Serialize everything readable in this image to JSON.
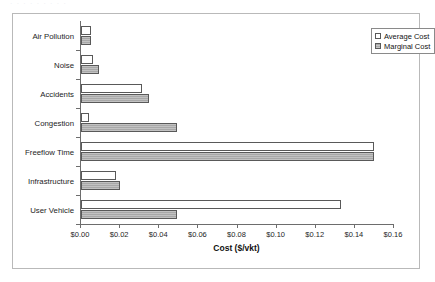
{
  "scan_artifact": "· · ·   · ·      ·   ·          ·      ·",
  "chart_data": {
    "type": "bar",
    "orientation": "horizontal",
    "title": "",
    "xlabel": "Cost  ($/vkt)",
    "ylabel": "",
    "categories": [
      "Air Pollution",
      "Noise",
      "Accidents",
      "Congestion",
      "Freeflow Time",
      "Infrastructure",
      "User Vehicle"
    ],
    "series": [
      {
        "name": "Average Cost",
        "swatch": "average-cost-swatch",
        "values": [
          0.005,
          0.006,
          0.031,
          0.004,
          0.15,
          0.018,
          0.133
        ]
      },
      {
        "name": "Marginal Cost",
        "swatch": "marginal-cost-swatch",
        "values": [
          0.005,
          0.009,
          0.035,
          0.049,
          0.15,
          0.02,
          0.049
        ]
      }
    ],
    "xlim": [
      0.0,
      0.16
    ],
    "xticks": [
      0.0,
      0.02,
      0.04,
      0.06,
      0.08,
      0.1,
      0.12,
      0.14,
      0.16
    ],
    "xticklabels": [
      "$0.00",
      "$0.02",
      "$0.04",
      "$0.06",
      "$0.08",
      "$0.10",
      "$0.12",
      "$0.14",
      "$0.16"
    ],
    "grid": false,
    "legend_position": "top-right",
    "colors": {
      "average_cost_fill": "#ffffff",
      "marginal_cost_fill": "#a8a8a8",
      "bar_outline": "#595959",
      "axis": "#6d6d6d",
      "frame": "#b9b9b9",
      "text": "#1d1d1d"
    }
  }
}
